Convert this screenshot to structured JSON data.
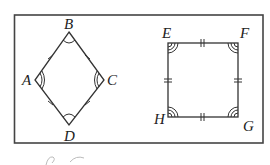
{
  "figure": {
    "rhombus": {
      "vertices": {
        "A": "A",
        "B": "B",
        "C": "C",
        "D": "D"
      },
      "description": "Rhombus ABCD with all four sides marked congruent (single tick), opposite angles A and C marked with double arcs, B and D with single arcs"
    },
    "square": {
      "vertices": {
        "E": "E",
        "F": "F",
        "G": "G",
        "H": "H"
      },
      "description": "Square EFGH with all four sides marked congruent (double tick) and all four angles marked with triple arcs"
    }
  }
}
